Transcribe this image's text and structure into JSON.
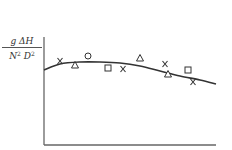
{
  "chart_data": {
    "type": "scatter",
    "title": "",
    "xlabel": "",
    "ylabel": "g ΔH / N² D²",
    "ylabel_parts": {
      "numerator": "g ΔH",
      "denominator_N": "N",
      "denominator_D": "D",
      "exponent": "2"
    },
    "grid": false,
    "legend": null,
    "axis_ticks": "none",
    "fit_curve": {
      "description": "smooth fitted curve: rises slightly from the y-axis, flat peak, then gently declines",
      "points_px": [
        [
          44,
          70
        ],
        [
          60,
          64
        ],
        [
          80,
          62
        ],
        [
          100,
          62
        ],
        [
          120,
          63
        ],
        [
          140,
          66
        ],
        [
          160,
          71
        ],
        [
          180,
          76
        ],
        [
          200,
          80
        ],
        [
          216,
          84
        ]
      ]
    },
    "series": [
      {
        "name": "cross",
        "symbol": "x",
        "points_px": [
          [
            60,
            61
          ],
          [
            123,
            69
          ],
          [
            165,
            64
          ],
          [
            193,
            82
          ]
        ]
      },
      {
        "name": "triangle",
        "symbol": "triangle",
        "points_px": [
          [
            75,
            65
          ],
          [
            140,
            58
          ],
          [
            168,
            74
          ]
        ]
      },
      {
        "name": "circle",
        "symbol": "circle",
        "points_px": [
          [
            88,
            56
          ]
        ]
      },
      {
        "name": "square",
        "symbol": "square",
        "points_px": [
          [
            108,
            68
          ],
          [
            188,
            70
          ]
        ]
      }
    ],
    "axes_px": {
      "origin": [
        44,
        145
      ],
      "y_top": 37,
      "x_right": 216
    },
    "colors": {
      "ink": "#333333",
      "axis": "#666666",
      "background": "#ffffff"
    }
  }
}
